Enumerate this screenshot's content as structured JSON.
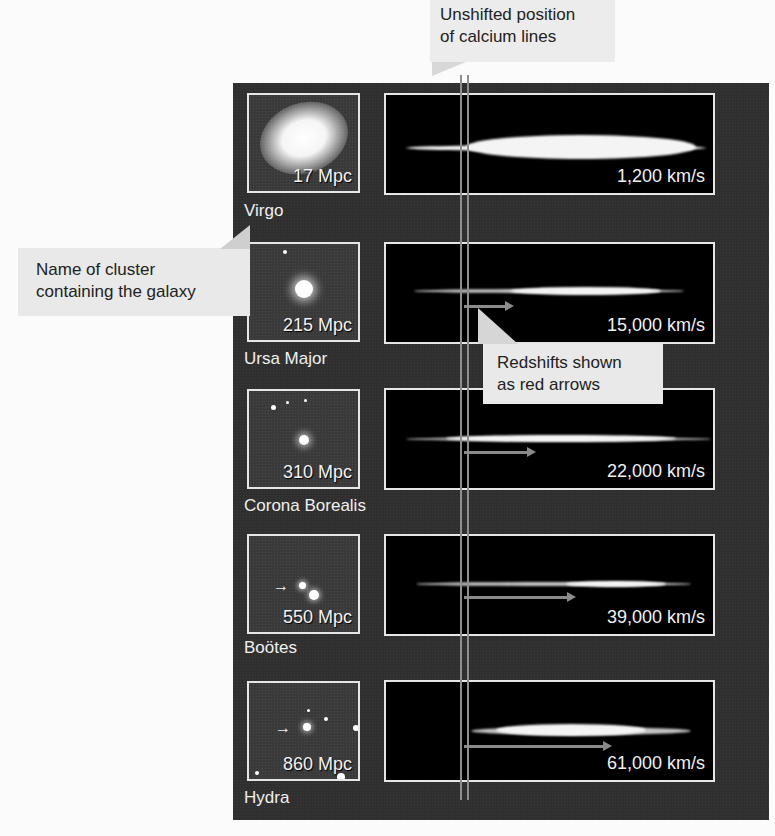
{
  "callouts": {
    "unshifted": "Unshifted position\nof calcium lines",
    "unshifted_line1": "Unshifted position",
    "unshifted_line2": "of calcium lines",
    "cluster_name_line1": "Name of cluster",
    "cluster_name_line2": "containing the galaxy",
    "redshift_line1": "Redshifts shown",
    "redshift_line2": "as red arrows"
  },
  "galaxies": [
    {
      "cluster": "Virgo",
      "distance": "17 Mpc",
      "velocity": "1,200 km/s"
    },
    {
      "cluster": "Ursa Major",
      "distance": "215 Mpc",
      "velocity": "15,000 km/s"
    },
    {
      "cluster": "Corona Borealis",
      "distance": "310 Mpc",
      "velocity": "22,000 km/s"
    },
    {
      "cluster": "Boötes",
      "distance": "550 Mpc",
      "velocity": "39,000 km/s"
    },
    {
      "cluster": "Hydra",
      "distance": "860 Mpc",
      "velocity": "61,000 km/s"
    }
  ],
  "colors": {
    "panel": "#2f2f2f",
    "callout": "#e9e9e9",
    "frame": "#e6e6e6",
    "arrow": "#8a8a8a"
  }
}
